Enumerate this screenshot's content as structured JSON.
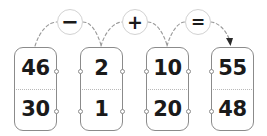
{
  "diagram": {
    "background_color": "#ffffff",
    "card_border_color": "#8b8b8b",
    "operator_circle_color": "#d2d2d2",
    "arc_color": "#9a9a9a",
    "number_color": "#1a1a1a",
    "cards": [
      {
        "name": "card-1",
        "top": "46",
        "bottom": "30",
        "x": 14,
        "y": 47,
        "nodes": [
          "right-up",
          "right-down"
        ]
      },
      {
        "name": "card-2",
        "top": "2",
        "bottom": "1",
        "x": 80,
        "y": 47,
        "nodes": [
          "left-up",
          "left-down",
          "right-up",
          "right-down"
        ]
      },
      {
        "name": "card-3",
        "top": "10",
        "bottom": "20",
        "x": 146,
        "y": 47,
        "nodes": [
          "left-up",
          "left-down",
          "right-up",
          "right-down"
        ]
      },
      {
        "name": "card-4",
        "top": "55",
        "bottom": "48",
        "x": 211,
        "y": 47,
        "nodes": [
          "left-up",
          "left-down"
        ]
      }
    ],
    "operators": [
      {
        "name": "operator-minus",
        "symbol": "−",
        "x": 70,
        "y": 22
      },
      {
        "name": "operator-plus",
        "symbol": "+",
        "x": 135,
        "y": 22
      },
      {
        "name": "operator-equals",
        "symbol": "=",
        "x": 198,
        "y": 22
      }
    ],
    "arrow": {
      "name": "result-arrow",
      "points_to": "card-4"
    }
  }
}
